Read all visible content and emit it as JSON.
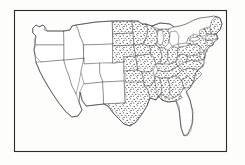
{
  "figure": {
    "title": "Map of the contiguous United States",
    "description": "Photocopied line map of the contiguous United States showing state boundaries, enclosed in a thin rectangular border. Central and eastern states are filled with a dense stipple (dot) pattern; western states and the Florida peninsula are left unshaded.",
    "medium": "scanned line drawing",
    "frame": {
      "visible": true,
      "x": 14,
      "y": 10,
      "width": 213,
      "height": 142,
      "stroke_color": "#2b2b2b"
    },
    "background_color": "#fdfdfc",
    "line_color": "#3a3a3a",
    "stipple_color": "#222222",
    "annotation_mark": "L"
  },
  "legend": {
    "shaded_label": "stippled (dotted) states",
    "unshaded_label": "unshaded states"
  },
  "map_data": {
    "type": "choropleth",
    "region": "contiguous United States",
    "projection": "generalized",
    "shading_modes": [
      "stippled",
      "unshaded"
    ],
    "stippled_states": [
      "North Dakota",
      "South Dakota",
      "Nebraska",
      "Kansas",
      "Oklahoma",
      "Minnesota",
      "Iowa",
      "Missouri",
      "Arkansas",
      "Louisiana",
      "Wisconsin",
      "Illinois",
      "Michigan",
      "Indiana",
      "Ohio",
      "Kentucky",
      "Tennessee",
      "Mississippi",
      "Alabama",
      "Georgia",
      "South Carolina",
      "North Carolina",
      "Virginia",
      "West Virginia",
      "Pennsylvania",
      "New York",
      "New Jersey",
      "Delaware",
      "Maryland",
      "Connecticut",
      "Rhode Island",
      "Massachusetts",
      "Vermont",
      "New Hampshire",
      "Maine",
      "Texas (eastern portion)",
      "Florida (panhandle)"
    ],
    "unshaded_states": [
      "Washington",
      "Oregon",
      "California",
      "Nevada",
      "Idaho",
      "Montana",
      "Wyoming",
      "Utah",
      "Colorado",
      "Arizona",
      "New Mexico",
      "Texas (western portion)",
      "Florida (peninsula)"
    ],
    "counts": {
      "stippled": 37,
      "unshaded": 13
    },
    "great_lakes_outlined": true
  }
}
